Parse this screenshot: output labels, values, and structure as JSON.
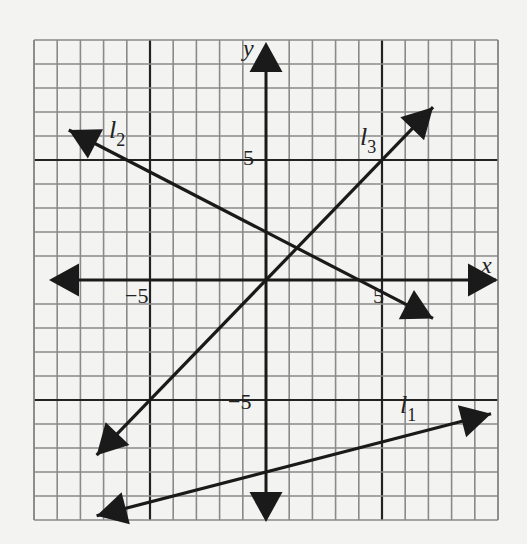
{
  "chart_data": {
    "type": "line",
    "title": "",
    "xlabel": "x",
    "ylabel": "y",
    "xlim": [
      -10,
      10
    ],
    "ylim": [
      -10,
      10
    ],
    "grid": true,
    "grid_step": 1,
    "bold_grid_lines": [
      -5,
      5
    ],
    "tick_labels": {
      "x": [
        {
          "value": -5,
          "label": "−5"
        },
        {
          "value": 5,
          "label": "5"
        }
      ],
      "y": [
        {
          "value": 5,
          "label": "5"
        },
        {
          "value": -5,
          "label": "−5"
        }
      ]
    },
    "series": [
      {
        "name": "l1",
        "label": "l",
        "subscript": "1",
        "equation": "y = x/4 - 8",
        "slope": 0.25,
        "intercept": -8,
        "x_range": [
          -7.3,
          9.7
        ],
        "points": [
          [
            -7.3,
            -9.8
          ],
          [
            0,
            -8
          ],
          [
            4,
            -7
          ],
          [
            9.7,
            -5.6
          ]
        ]
      },
      {
        "name": "l2",
        "label": "l",
        "subscript": "2",
        "equation": "y = -x/2 + 2",
        "slope": -0.5,
        "intercept": 2,
        "x_range": [
          -8.5,
          7.2
        ],
        "points": [
          [
            -8.5,
            6.25
          ],
          [
            0,
            2
          ],
          [
            4,
            0
          ],
          [
            7.2,
            -1.6
          ]
        ]
      },
      {
        "name": "l3",
        "label": "l",
        "subscript": "3",
        "equation": "y = x",
        "slope": 1,
        "intercept": 0,
        "x_range": [
          -7.3,
          7.2
        ],
        "points": [
          [
            -7.3,
            -7.3
          ],
          [
            0,
            0
          ],
          [
            5,
            5
          ],
          [
            7.2,
            7.2
          ]
        ]
      }
    ],
    "legend": "inline labels near each line"
  },
  "labels": {
    "x_axis": "x",
    "y_axis": "y",
    "tick_x_neg5": "−5",
    "tick_x_5": "5",
    "tick_y_5": "5",
    "tick_y_neg5": "−5",
    "l1_base": "l",
    "l1_sub": "1",
    "l2_base": "l",
    "l2_sub": "2",
    "l3_base": "l",
    "l3_sub": "3"
  }
}
